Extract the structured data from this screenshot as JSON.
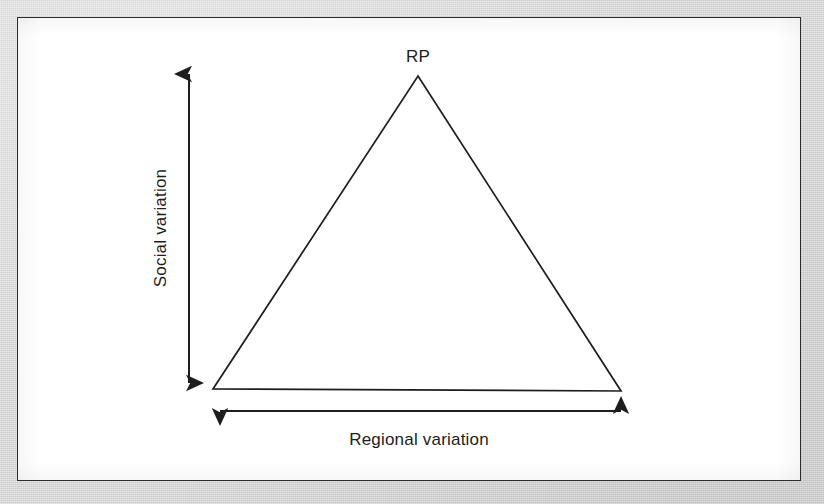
{
  "figure": {
    "type": "diagram"
  },
  "colors": {
    "page_background": "#d3d3d3",
    "figure_background": "#ffffff",
    "frame_stroke": "#2b2b2b",
    "line_stroke": "#1d1d1d",
    "text": "#1d1d1d"
  },
  "labels": {
    "apex": "RP",
    "vertical_axis": "Social variation",
    "horizontal_axis": "Regional variation"
  },
  "geometry": {
    "triangle": {
      "apex": {
        "x": 400,
        "y": 58
      },
      "base_left": {
        "x": 195,
        "y": 371
      },
      "base_right": {
        "x": 603,
        "y": 373
      },
      "points": "400,58 603,373 195,371"
    },
    "vertical_arrow": {
      "x": 171,
      "y_top": 56,
      "y_bottom": 365
    },
    "horizontal_arrow": {
      "y": 393,
      "x_left": 202,
      "x_right": 603
    },
    "apex_label_anchor": {
      "x": 400,
      "y": 44
    },
    "vertical_label_anchor": {
      "x": 148,
      "y": 210
    },
    "horizontal_label_anchor": {
      "x": 401,
      "y": 427
    }
  }
}
